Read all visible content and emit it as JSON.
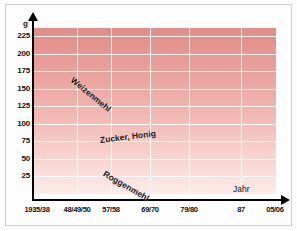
{
  "figure": {
    "unit_label": "g",
    "x_axis_title": "Jahr"
  },
  "chart_data": {
    "type": "line",
    "title": "",
    "subtitle": "",
    "xlabel": "Jahr",
    "ylabel": "g",
    "grid": true,
    "legend_position": "inline-on-curves",
    "categories": [
      "1935/38",
      "48/49/50",
      "57/58",
      "69/70",
      "79/80",
      "87",
      "05/06"
    ],
    "x_tick_labels": [
      "1935/38",
      "48/49/50",
      "57/58",
      "69/70",
      "79/80",
      "87",
      "05/06"
    ],
    "y_tick_labels": [
      "225",
      "200",
      "175",
      "150",
      "125",
      "100",
      "75",
      "50",
      "25"
    ],
    "ylim": [
      0,
      237
    ],
    "y_ticks": [
      25,
      50,
      75,
      100,
      125,
      150,
      175,
      200,
      225
    ],
    "series": [
      {
        "name": "Weizenmehl",
        "style": "solid",
        "color": "#141414",
        "x": [
          "1935/38",
          "1948",
          "48/49/50",
          "57/58",
          "69/70",
          "79/80",
          "87",
          "05/06"
        ],
        "values": [
          173,
          213,
          188,
          160,
          132,
          137,
          145,
          180
        ]
      },
      {
        "name": "Zucker, Honig",
        "style": "dash-dot",
        "color": "#141414",
        "x": [
          "1935/38",
          "1946",
          "48/49/50",
          "57/58",
          "69/70",
          "79/80",
          "87",
          "05/06"
        ],
        "values": [
          73,
          55,
          68,
          82,
          92,
          99,
          103,
          106
        ]
      },
      {
        "name": "Roggenmehl",
        "style": "dotted",
        "color": "#141414",
        "x": [
          "1935/38",
          "48/49/50",
          "57/58",
          "69/70",
          "79/80",
          "87",
          "2004",
          "05/06"
        ],
        "values": [
          135,
          107,
          82,
          52,
          30,
          37,
          60,
          28
        ]
      }
    ]
  },
  "colors": {
    "plot_background_top": "#e08d88",
    "plot_background_bottom": "#fcecea",
    "gridline": "#ffffff",
    "axis": "#000000",
    "series_line": "#141414"
  }
}
